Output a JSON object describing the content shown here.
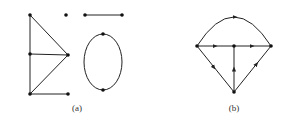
{
  "figure": {
    "subfigures": [
      {
        "label": "(a)",
        "vertices": [
          {
            "id": "a1",
            "x": 30,
            "y": 15
          },
          {
            "id": "a2",
            "x": 66,
            "y": 15
          },
          {
            "id": "a3",
            "x": 85,
            "y": 15
          },
          {
            "id": "a4",
            "x": 122,
            "y": 15
          },
          {
            "id": "a5",
            "x": 30,
            "y": 54
          },
          {
            "id": "a6",
            "x": 68,
            "y": 55
          },
          {
            "id": "a7",
            "x": 103,
            "y": 34
          },
          {
            "id": "a8",
            "x": 103,
            "y": 90
          },
          {
            "id": "a9",
            "x": 30,
            "y": 94
          },
          {
            "id": "a10",
            "x": 68,
            "y": 94
          }
        ],
        "edges": [
          [
            "a1",
            "a5"
          ],
          [
            "a5",
            "a9"
          ],
          [
            "a1",
            "a6"
          ],
          [
            "a5",
            "a6"
          ],
          [
            "a9",
            "a6"
          ],
          [
            "a9",
            "a10"
          ],
          [
            "a3",
            "a4"
          ]
        ],
        "ellipse": {
          "cx": 103,
          "cy": 62,
          "rx": 19,
          "ry": 28
        }
      },
      {
        "label": "(b)",
        "vertices": [
          {
            "id": "b1",
            "x": 197,
            "y": 46
          },
          {
            "id": "b2",
            "x": 234,
            "y": 46
          },
          {
            "id": "b3",
            "x": 271,
            "y": 46
          },
          {
            "id": "b4",
            "x": 234,
            "y": 92
          }
        ],
        "directed": true
      }
    ]
  }
}
